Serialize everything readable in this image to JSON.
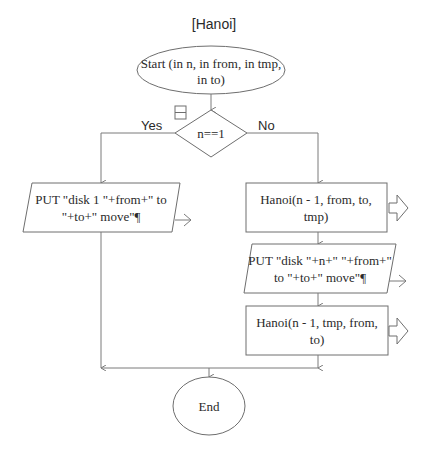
{
  "diagram": {
    "title": "[Hanoi]",
    "start": {
      "label_line1": "Start (in n, in from, in tmp,",
      "label_line2": "in to)"
    },
    "decision": {
      "condition": "n==1",
      "yes_label": "Yes",
      "no_label": "No"
    },
    "yes_branch": {
      "output": {
        "line1": "PUT \"disk 1 \"+from+\" to",
        "line2": "\"+to+\" move\"¶"
      }
    },
    "no_branch": {
      "call1": {
        "line1": "Hanoi(n - 1,  from,  to,",
        "line2": "tmp)"
      },
      "output": {
        "line1": "PUT \"disk \"+n+\" \"+from+\"",
        "line2": "to \"+to+\" move\"¶"
      },
      "call2": {
        "line1": "Hanoi(n - 1,  tmp,  from,",
        "line2": "to)"
      }
    },
    "end": {
      "label": "End"
    },
    "icons": {
      "collapse": "collapse-box-icon",
      "output_arrow": "output-arrow-icon",
      "call_arrow": "call-hollow-arrow-icon"
    }
  }
}
